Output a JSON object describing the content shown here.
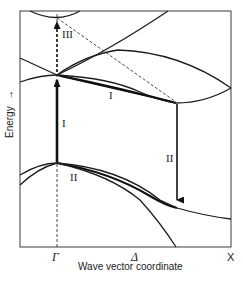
{
  "figure": {
    "type": "band-structure-diagram",
    "xlabel": "Wave vector coordinate",
    "ylabel": "Energy",
    "ylabel_arrow": "→",
    "x_ticks": [
      "Γ",
      "Δ",
      "X"
    ],
    "transitions": [
      {
        "id": "I-vertical",
        "label": "I",
        "kind": "vertical excitation at Γ (valence top → conduction minimum)"
      },
      {
        "id": "I-scatter",
        "label": "I",
        "kind": "intervalley relaxation along Δ"
      },
      {
        "id": "II-vertical",
        "label": "II",
        "kind": "recombination at side valley"
      },
      {
        "id": "II-valence",
        "label": "II",
        "kind": "valence band label"
      },
      {
        "id": "III",
        "label": "III",
        "kind": "vertical excitation at Γ to upper band (dashed)"
      }
    ],
    "colors": {
      "ink": "#1e1e1e",
      "background": "#ffffff"
    }
  }
}
